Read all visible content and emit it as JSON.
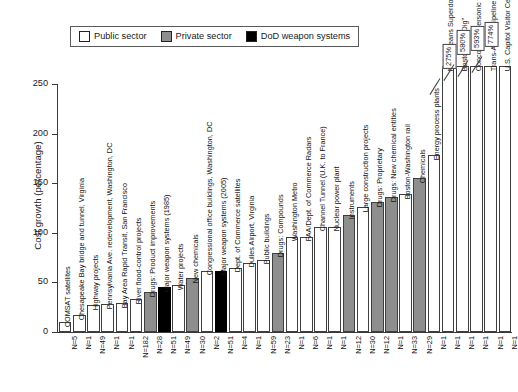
{
  "legend": {
    "items": [
      {
        "label": "Public sector",
        "key": "public",
        "color": "#ffffff"
      },
      {
        "label": "Private sector",
        "key": "private",
        "color": "#8e8e8e"
      },
      {
        "label": "DoD weapon systems",
        "key": "dod",
        "color": "#000000"
      }
    ]
  },
  "caption": "",
  "chart_data": {
    "type": "bar",
    "title": "",
    "xlabel": "",
    "ylabel": "Cost growth (percentage)",
    "ylim": [
      0,
      250
    ],
    "yticks": [
      0,
      50,
      100,
      150,
      200,
      250
    ],
    "grid": false,
    "legend_position": "top-left",
    "categories": [
      "COMSAT satellites",
      "Chesapeake Bay bridge and tunnel, Virginia",
      "Highway projects",
      "Pennsylvania Ave. redevelopment, Washington, DC",
      "Bay Area Rapid Transit, San Francisco",
      "River flood-control projects",
      "Drugs: Product improvements",
      "Major weapon systems (1985)",
      "Water projects",
      "New chemicals",
      "Congressional office buildings, Washington, DC",
      "Major weapon systems (2005)",
      "Dept. of Commerce satellites",
      "Dulles Airport, Virginia",
      "Public buildings",
      "Drugs: Compounds",
      "Washington Metro",
      "FAA/Dept. of Commerce Radars",
      "Channel Tunnel (U.K. to France)",
      "Nuclear power plant",
      "Instruments",
      "Large construction projects",
      "Drugs: Proprietary",
      "Drugs: New chemical entities",
      "Boston-Washington rail",
      "Chemicals",
      "Energy process plants",
      "New Orleans Superdome",
      "Boston \"Big Dig\"",
      "Concorde supersonic transport",
      "Trans-Alaska Pipeline System",
      "U.S. Capitol Visitor Center"
    ],
    "values": [
      10,
      17,
      27,
      28,
      29,
      33,
      40,
      45,
      47,
      54,
      62,
      62,
      65,
      70,
      73,
      80,
      96,
      96,
      106,
      106,
      118,
      126,
      131,
      136,
      139,
      155,
      178,
      275,
      580,
      593,
      774,
      774
    ],
    "sectors": [
      "public",
      "public",
      "public",
      "public",
      "public",
      "public",
      "private",
      "dod",
      "public",
      "private",
      "public",
      "dod",
      "public",
      "public",
      "public",
      "private",
      "public",
      "public",
      "public",
      "public",
      "private",
      "public",
      "private",
      "private",
      "public",
      "private",
      "public",
      "public",
      "public",
      "public",
      "public",
      "public"
    ],
    "sample_sizes": [
      "N=5",
      "N=1",
      "N=49",
      "N=1",
      "N=1",
      "N=182",
      "N=28",
      "N=51",
      "N=49",
      "N=30",
      "N=2",
      "N=51",
      "N=4",
      "N=1",
      "N=59",
      "N=23",
      "N=1",
      "N=6",
      "N=1",
      "N=1",
      "N=12",
      "N=30",
      "N=12",
      "N=1",
      "N=33",
      "N=29",
      "N=1",
      "N=1",
      "N=1",
      "N=1",
      "N=1",
      "N=1"
    ],
    "clipped_bars": [
      {
        "category": "New Orleans Superdome",
        "label": "275%"
      },
      {
        "category": "Boston \"Big Dig\"",
        "label": "580%"
      },
      {
        "category": "Concorde supersonic transport",
        "label": "593%"
      },
      {
        "category": "Trans-Alaska Pipeline System",
        "label": "774%"
      }
    ]
  }
}
